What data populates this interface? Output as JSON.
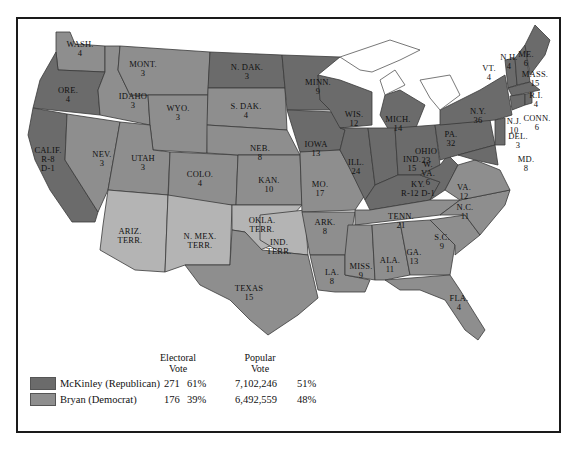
{
  "colors": {
    "republican": "#6b6b6b",
    "democrat": "#8e8e8e",
    "territory": "#b4b4b4",
    "water": "#ffffff",
    "border": "#3a3a3a"
  },
  "states": [
    {
      "name": "WASH.",
      "ev": "4",
      "party": "democrat"
    },
    {
      "name": "ORE.",
      "ev": "4",
      "party": "republican"
    },
    {
      "name": "CALIF.",
      "ev": "R-8\nD-1",
      "party": "republican"
    },
    {
      "name": "IDAHO",
      "ev": "3",
      "party": "democrat"
    },
    {
      "name": "NEV.",
      "ev": "3",
      "party": "democrat"
    },
    {
      "name": "MONT.",
      "ev": "3",
      "party": "democrat"
    },
    {
      "name": "WYO.",
      "ev": "3",
      "party": "democrat"
    },
    {
      "name": "UTAH",
      "ev": "3",
      "party": "democrat"
    },
    {
      "name": "COLO.",
      "ev": "4",
      "party": "democrat"
    },
    {
      "name": "ARIZ.\nTERR.",
      "ev": "",
      "party": "territory"
    },
    {
      "name": "N. MEX.\nTERR.",
      "ev": "",
      "party": "territory"
    },
    {
      "name": "N. DAK.",
      "ev": "3",
      "party": "republican"
    },
    {
      "name": "S. DAK.",
      "ev": "4",
      "party": "democrat"
    },
    {
      "name": "NEB.",
      "ev": "8",
      "party": "democrat"
    },
    {
      "name": "KAN.",
      "ev": "10",
      "party": "democrat"
    },
    {
      "name": "OKLA.\nTERR.",
      "ev": "",
      "party": "territory"
    },
    {
      "name": "IND.\nTERR.",
      "ev": "",
      "party": "territory"
    },
    {
      "name": "TEXAS",
      "ev": "15",
      "party": "democrat"
    },
    {
      "name": "MINN.",
      "ev": "9",
      "party": "republican"
    },
    {
      "name": "IOWA",
      "ev": "13",
      "party": "republican"
    },
    {
      "name": "MO.",
      "ev": "17",
      "party": "democrat"
    },
    {
      "name": "ARK.",
      "ev": "8",
      "party": "democrat"
    },
    {
      "name": "LA.",
      "ev": "8",
      "party": "democrat"
    },
    {
      "name": "WIS.",
      "ev": "12",
      "party": "republican"
    },
    {
      "name": "ILL.",
      "ev": "24",
      "party": "republican"
    },
    {
      "name": "MICH.",
      "ev": "14",
      "party": "republican"
    },
    {
      "name": "IND.",
      "ev": "15",
      "party": "republican"
    },
    {
      "name": "OHIO",
      "ev": "23",
      "party": "republican"
    },
    {
      "name": "KY.",
      "ev": "R-12 D-1",
      "party": "republican"
    },
    {
      "name": "TENN.",
      "ev": "21",
      "party": "democrat"
    },
    {
      "name": "MISS.",
      "ev": "9",
      "party": "democrat"
    },
    {
      "name": "ALA.",
      "ev": "11",
      "party": "democrat"
    },
    {
      "name": "GA.",
      "ev": "13",
      "party": "democrat"
    },
    {
      "name": "FLA.",
      "ev": "4",
      "party": "democrat"
    },
    {
      "name": "S.C.",
      "ev": "9",
      "party": "democrat"
    },
    {
      "name": "N.C.",
      "ev": "11",
      "party": "democrat"
    },
    {
      "name": "VA.",
      "ev": "12",
      "party": "democrat"
    },
    {
      "name": "W.\nVA.",
      "ev": "6",
      "party": "republican"
    },
    {
      "name": "PA.",
      "ev": "32",
      "party": "republican"
    },
    {
      "name": "N.Y.",
      "ev": "36",
      "party": "republican"
    },
    {
      "name": "VT.",
      "ev": "4",
      "party": "republican"
    },
    {
      "name": "N.H.",
      "ev": "4",
      "party": "republican"
    },
    {
      "name": "ME.",
      "ev": "6",
      "party": "republican"
    },
    {
      "name": "MASS.",
      "ev": "15",
      "party": "republican"
    },
    {
      "name": "R.I.",
      "ev": "4",
      "party": "republican"
    },
    {
      "name": "CONN.",
      "ev": "6",
      "party": "republican"
    },
    {
      "name": "N.J.",
      "ev": "10",
      "party": "republican"
    },
    {
      "name": "DEL.",
      "ev": "3",
      "party": "republican"
    },
    {
      "name": "MD.",
      "ev": "8",
      "party": "republican"
    }
  ],
  "legend": {
    "electoral_header": "Electoral\nVote",
    "popular_header": "Popular\nVote",
    "rows": [
      {
        "candidate": "McKinley (Republican)",
        "ev": "271",
        "ev_pct": "61%",
        "pop": "7,102,246",
        "pop_pct": "51%",
        "party": "republican"
      },
      {
        "candidate": "Bryan (Democrat)",
        "ev": "176",
        "ev_pct": "39%",
        "pop": "6,492,559",
        "pop_pct": "48%",
        "party": "democrat"
      }
    ]
  }
}
